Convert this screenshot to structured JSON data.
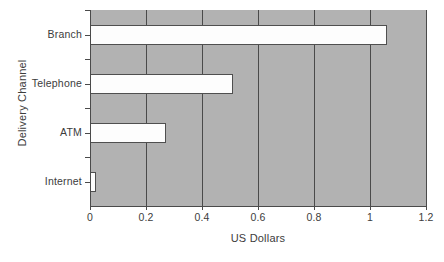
{
  "chart_data": {
    "type": "bar",
    "orientation": "horizontal",
    "title": "",
    "xlabel": "US Dollars",
    "ylabel": "Delivery Channel",
    "categories": [
      "Branch",
      "Telephone",
      "ATM",
      "Internet"
    ],
    "values": [
      1.06,
      0.51,
      0.27,
      0.02
    ],
    "xlim": [
      0,
      1.2
    ],
    "xticks": [
      0,
      0.2,
      0.4,
      0.6,
      0.8,
      1,
      1.2
    ],
    "xtick_labels": [
      "0",
      "0.2",
      "0.4",
      "0.6",
      "0.8",
      "1",
      "1.2"
    ],
    "grid": true,
    "grid_axis": "x",
    "legend": false,
    "legend_position": "none",
    "plot_background_color": "#b2b2b2",
    "figure_background_color": "#ffffff",
    "bar_fill_color": "#fdfdfd",
    "bar_edge_color": "#4f4f4f",
    "grid_color": "#4a4a4a",
    "axis_color": "#4a4a4a",
    "text_color": "#3c3c3c"
  }
}
